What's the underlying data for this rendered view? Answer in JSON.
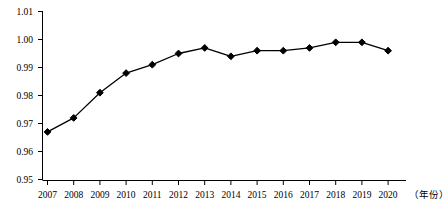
{
  "chart_data": {
    "type": "line",
    "title": "",
    "subtitle": "",
    "xlabel": "（年份）",
    "ylabel": "",
    "categories": [
      "2007",
      "2008",
      "2009",
      "2010",
      "2011",
      "2012",
      "2013",
      "2014",
      "2015",
      "2016",
      "2017",
      "2018",
      "2019",
      "2020"
    ],
    "values": [
      0.967,
      0.972,
      0.981,
      0.988,
      0.991,
      0.995,
      0.997,
      0.994,
      0.996,
      0.996,
      0.997,
      0.999,
      0.999,
      0.996
    ],
    "series": [
      {
        "name": "",
        "values": [
          0.967,
          0.972,
          0.981,
          0.988,
          0.991,
          0.995,
          0.997,
          0.994,
          0.996,
          0.996,
          0.997,
          0.999,
          0.999,
          0.996
        ]
      }
    ],
    "ylim": [
      0.95,
      1.01
    ],
    "xlim": [
      "2007",
      "2020"
    ],
    "y_ticks": [
      "0.95",
      "0.96",
      "0.97",
      "0.98",
      "0.99",
      "1.00",
      "1.01"
    ],
    "y_tick_values": [
      0.95,
      0.96,
      0.97,
      0.98,
      0.99,
      1.0,
      1.01
    ],
    "x_ticks": [
      "2007",
      "2008",
      "2009",
      "2010",
      "2011",
      "2012",
      "2013",
      "2014",
      "2015",
      "2016",
      "2017",
      "2018",
      "2019",
      "2020"
    ],
    "grid": false,
    "legend": null,
    "legend_position": "none",
    "marker": "diamond",
    "line_color": "#000000",
    "marker_color": "#000000",
    "axis_color": "#000000"
  }
}
